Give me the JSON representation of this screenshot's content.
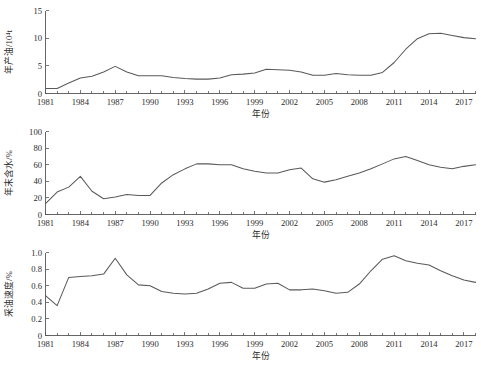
{
  "figure": {
    "background": "#ffffff",
    "line_color": "#5a5a5a",
    "axis_color": "#555555",
    "text_color": "#2b2b2b",
    "panel_count": 3
  },
  "chart_data": [
    {
      "type": "line",
      "title": "",
      "xlabel": "年份",
      "ylabel": "年产油/10⁴t",
      "xlim": [
        1981,
        2018
      ],
      "ylim": [
        0,
        15
      ],
      "yticks": [
        0,
        5,
        10,
        15
      ],
      "ytick_labels": [
        "0",
        "5",
        "10",
        "15"
      ],
      "xticks": [
        1981,
        1984,
        1987,
        1990,
        1993,
        1996,
        1999,
        2002,
        2005,
        2008,
        2011,
        2014,
        2017
      ],
      "xtick_labels": [
        "1981",
        "1984",
        "1987",
        "1990",
        "1993",
        "1996",
        "1999",
        "2002",
        "2005",
        "2008",
        "2011",
        "2014",
        "2017"
      ],
      "minor_tick_every": 1,
      "grid": false,
      "legend": null,
      "x": [
        1981,
        1982,
        1983,
        1984,
        1985,
        1986,
        1987,
        1988,
        1989,
        1990,
        1991,
        1992,
        1993,
        1994,
        1995,
        1996,
        1997,
        1998,
        1999,
        2000,
        2001,
        2002,
        2003,
        2004,
        2005,
        2006,
        2007,
        2008,
        2009,
        2010,
        2011,
        2012,
        2013,
        2014,
        2015,
        2016,
        2017,
        2018
      ],
      "values": [
        0.9,
        0.9,
        1.9,
        2.8,
        3.1,
        3.9,
        4.9,
        3.9,
        3.2,
        3.2,
        3.2,
        2.9,
        2.7,
        2.6,
        2.6,
        2.8,
        3.4,
        3.5,
        3.7,
        4.4,
        4.3,
        4.2,
        3.9,
        3.3,
        3.3,
        3.6,
        3.4,
        3.3,
        3.3,
        3.8,
        5.6,
        8.0,
        9.9,
        10.8,
        10.9,
        10.5,
        10.1,
        9.9
      ]
    },
    {
      "type": "line",
      "title": "",
      "xlabel": "年份",
      "ylabel": "年末含水/%",
      "xlim": [
        1981,
        2018
      ],
      "ylim": [
        0,
        100
      ],
      "yticks": [
        0,
        20,
        40,
        60,
        80,
        100
      ],
      "ytick_labels": [
        "0",
        "20",
        "40",
        "60",
        "80",
        "100"
      ],
      "xticks": [
        1981,
        1984,
        1987,
        1990,
        1993,
        1996,
        1999,
        2002,
        2005,
        2008,
        2011,
        2014,
        2017
      ],
      "xtick_labels": [
        "1981",
        "1984",
        "1987",
        "1990",
        "1993",
        "1996",
        "1999",
        "2002",
        "2005",
        "2008",
        "2011",
        "2014",
        "2017"
      ],
      "minor_tick_every": 1,
      "grid": false,
      "legend": null,
      "x": [
        1981,
        1982,
        1983,
        1984,
        1985,
        1986,
        1987,
        1988,
        1989,
        1990,
        1991,
        1992,
        1993,
        1994,
        1995,
        1996,
        1997,
        1998,
        1999,
        2000,
        2001,
        2002,
        2003,
        2004,
        2005,
        2006,
        2007,
        2008,
        2009,
        2010,
        2011,
        2012,
        2013,
        2014,
        2015,
        2016,
        2017,
        2018
      ],
      "values": [
        13,
        27,
        33,
        46,
        28,
        19,
        21,
        24,
        23,
        23,
        38,
        48,
        55,
        61,
        61,
        60,
        60,
        55,
        52,
        50,
        50,
        54,
        56,
        43,
        39,
        42,
        46,
        50,
        55,
        61,
        67,
        70,
        65,
        60,
        57,
        55,
        58,
        60
      ]
    },
    {
      "type": "line",
      "title": "",
      "xlabel": "年份",
      "ylabel": "采油速度/%",
      "xlim": [
        1981,
        2018
      ],
      "ylim": [
        0,
        1.0
      ],
      "yticks": [
        0,
        0.2,
        0.4,
        0.6,
        0.8,
        1.0
      ],
      "ytick_labels": [
        "0",
        "0.2",
        "0.4",
        "0.6",
        "0.8",
        "1.0"
      ],
      "xticks": [
        1981,
        1984,
        1987,
        1990,
        1993,
        1996,
        1999,
        2002,
        2005,
        2008,
        2011,
        2014,
        2017
      ],
      "xtick_labels": [
        "1981",
        "1984",
        "1987",
        "1990",
        "1993",
        "1996",
        "1999",
        "2002",
        "2005",
        "2008",
        "2011",
        "2014",
        "2017"
      ],
      "minor_tick_every": 1,
      "grid": false,
      "legend": null,
      "x": [
        1981,
        1982,
        1983,
        1984,
        1985,
        1986,
        1987,
        1988,
        1989,
        1990,
        1991,
        1992,
        1993,
        1994,
        1995,
        1996,
        1997,
        1998,
        1999,
        2000,
        2001,
        2002,
        2003,
        2004,
        2005,
        2006,
        2007,
        2008,
        2009,
        2010,
        2011,
        2012,
        2013,
        2014,
        2015,
        2016,
        2017,
        2018
      ],
      "values": [
        0.48,
        0.36,
        0.7,
        0.71,
        0.72,
        0.74,
        0.93,
        0.73,
        0.61,
        0.6,
        0.53,
        0.51,
        0.5,
        0.51,
        0.56,
        0.63,
        0.64,
        0.57,
        0.57,
        0.62,
        0.63,
        0.55,
        0.55,
        0.56,
        0.54,
        0.51,
        0.52,
        0.62,
        0.78,
        0.92,
        0.96,
        0.9,
        0.87,
        0.85,
        0.78,
        0.72,
        0.67,
        0.64
      ]
    }
  ]
}
